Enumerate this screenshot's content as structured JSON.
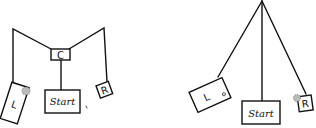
{
  "diagram": {
    "left_figure": {
      "center_label": "C",
      "left_label": "L",
      "right_label": "R",
      "start_label": "Start"
    },
    "right_figure": {
      "left_label": "L",
      "right_label": "R",
      "start_label": "Start"
    },
    "colors": {
      "stroke": "#111111",
      "background": "#ffffff"
    }
  }
}
